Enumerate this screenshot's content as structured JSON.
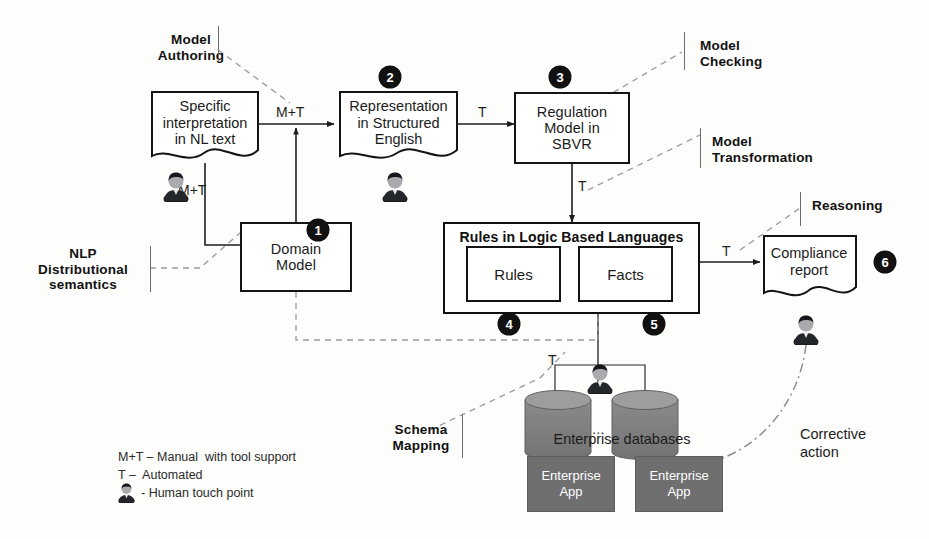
{
  "diagram": {
    "nodes": {
      "specific_interpretation": "Specific\ninterpretation\nin NL text",
      "specific_interpretation_lines": [
        "Specific",
        "interpretation",
        "in NL text"
      ],
      "representation": [
        "Representation",
        "in Structured",
        "English"
      ],
      "regulation_model": [
        "Regulation",
        "Model in",
        "SBVR"
      ],
      "domain_model": [
        "Domain",
        "Model"
      ],
      "rules_container_title": "Rules in Logic Based Languages",
      "rules_box": "Rules",
      "facts_box": "Facts",
      "compliance_report": [
        "Compliance",
        "report"
      ],
      "enterprise_databases": "Enterprise databases",
      "enterprise_app_1": [
        "Enterprise",
        "App"
      ],
      "enterprise_app_2": [
        "Enterprise",
        "App"
      ],
      "db_ellipsis": "..."
    },
    "badges": [
      "1",
      "2",
      "3",
      "4",
      "5",
      "6"
    ],
    "phases": {
      "model_authoring": [
        "Model",
        "Authoring"
      ],
      "model_checking": [
        "Model",
        "Checking"
      ],
      "model_transformation": [
        "Model",
        "Transformation"
      ],
      "reasoning": [
        "Reasoning"
      ],
      "nlp_distributional": [
        "NLP",
        "Distributional",
        "semantics"
      ],
      "schema_mapping": [
        "Schema",
        "Mapping"
      ]
    },
    "edge_labels": {
      "nl_to_repr": "M+T",
      "person_to_domain": "M+T",
      "repr_to_sbvr": "T",
      "sbvr_to_rules": "T",
      "facts_to_report": "T",
      "db_to_facts": "T"
    },
    "annotations": {
      "corrective_action": [
        "Corrective",
        "action"
      ]
    },
    "legend": {
      "line1": "M+T – Manual  with tool support",
      "line2": "T –  Automated",
      "line3": "- Human touch point",
      "icon": "person-icon"
    },
    "colors": {
      "stroke": "#141414",
      "dashed": "#8c8c8c",
      "badge_bg": "#111111",
      "app_fill": "#6f6f6f",
      "db_fill": "#7d7d7d",
      "db_top": "#9b9b9b"
    }
  }
}
